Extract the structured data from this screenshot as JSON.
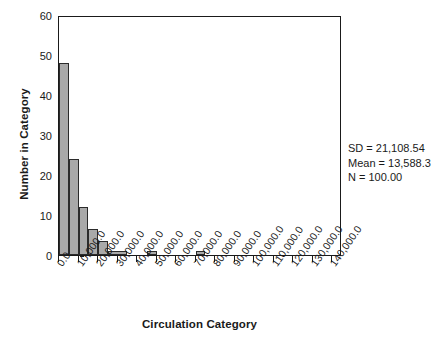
{
  "chart_data": {
    "type": "bar",
    "title": "",
    "subtitle": "",
    "xlabel": "Circulation Category",
    "ylabel": "Number in Category",
    "grid": false,
    "legend": null,
    "xlim": [
      0,
      145000
    ],
    "ylim": [
      0,
      60
    ],
    "bin_width": 5000,
    "x_tick_labels": [
      "0.0",
      "10,000.0",
      "20,000.0",
      "30,000.0",
      "40,000.0",
      "50,000.0",
      "60,000.0",
      "70,000.0",
      "80,000.0",
      "90,000.0",
      "100,000.0",
      "110,000.0",
      "120,000.0",
      "130,000.0",
      "140,000.0"
    ],
    "x_tick_values": [
      0,
      10000,
      20000,
      30000,
      40000,
      50000,
      60000,
      70000,
      80000,
      90000,
      100000,
      110000,
      120000,
      130000,
      140000
    ],
    "y_tick_labels": [
      "0",
      "10",
      "20",
      "30",
      "40",
      "50",
      "60"
    ],
    "y_tick_values": [
      0,
      10,
      20,
      30,
      40,
      50,
      60
    ],
    "bars": [
      {
        "bin_start": 0,
        "bin_end": 5000,
        "value": 48
      },
      {
        "bin_start": 5000,
        "bin_end": 10000,
        "value": 24
      },
      {
        "bin_start": 10000,
        "bin_end": 15000,
        "value": 12
      },
      {
        "bin_start": 15000,
        "bin_end": 20000,
        "value": 6.5
      },
      {
        "bin_start": 20000,
        "bin_end": 25000,
        "value": 3.5
      },
      {
        "bin_start": 25000,
        "bin_end": 35000,
        "value": 1
      },
      {
        "bin_start": 45000,
        "bin_end": 50000,
        "value": 1
      },
      {
        "bin_start": 70000,
        "bin_end": 75000,
        "value": 1
      }
    ],
    "bar_fill_color": "#a9a9a9",
    "bar_edge_color": "#2b2b2b",
    "axis_color": "#1a1a1a",
    "background_color": "#ffffff"
  },
  "annotations": {
    "sd": "SD = 21,108.54",
    "mean": "Mean = 13,588.3",
    "n": "N = 100.00"
  }
}
